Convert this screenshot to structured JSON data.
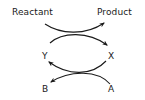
{
  "diagram": {
    "type": "coupled-reactions",
    "labels": {
      "reactant": "Reactant",
      "product": "Product",
      "y": "Y",
      "x": "X",
      "b": "B",
      "a": "A"
    },
    "edges": [
      {
        "from": "Reactant",
        "to": "Product"
      },
      {
        "from": "Y",
        "to": "X"
      },
      {
        "from": "X",
        "to": "Y"
      },
      {
        "from": "A",
        "to": "B"
      }
    ],
    "colors": {
      "stroke": "#1a1a1a",
      "background": "#ffffff"
    }
  }
}
